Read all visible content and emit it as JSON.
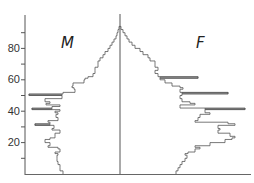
{
  "chart_data": {
    "type": "bar",
    "subtype": "population-pyramid",
    "title": "",
    "xlabel": "",
    "ylabel": "",
    "ylim": [
      0,
      95
    ],
    "yticks_major": [
      20,
      40,
      60,
      80
    ],
    "yticks_minor": [
      10,
      30,
      50,
      70,
      90
    ],
    "grid": false,
    "legend": "none",
    "series_labels": {
      "male": "M",
      "female": "F"
    },
    "units_note": "relative counts (arbitrary units)",
    "ages": [
      0,
      2,
      4,
      6,
      8,
      10,
      12,
      13,
      14,
      16,
      17,
      18,
      20,
      22,
      23,
      24,
      26,
      28,
      29,
      31,
      32,
      33,
      34,
      36,
      38,
      39,
      40,
      41,
      42,
      43,
      44,
      45,
      46,
      48,
      50,
      51,
      52,
      54,
      55,
      56,
      58,
      60,
      61,
      62,
      64,
      66,
      68,
      70,
      72,
      74,
      76,
      78,
      80,
      82,
      84,
      86,
      88,
      90,
      92
    ],
    "series": [
      {
        "name": "M",
        "values": [
          57,
          60,
          60,
          62,
          63,
          63,
          62,
          65,
          60,
          62,
          72,
          70,
          75,
          70,
          65,
          65,
          60,
          68,
          66,
          85,
          70,
          72,
          62,
          64,
          62,
          65,
          60,
          88,
          68,
          60,
          74,
          70,
          75,
          58,
          91,
          57,
          45,
          46,
          48,
          47,
          36,
          35,
          32,
          27,
          25,
          25,
          22,
          22,
          20,
          17,
          15,
          12,
          10,
          8,
          6,
          4,
          3,
          2,
          1
        ]
      },
      {
        "name": "F",
        "values": [
          56,
          58,
          60,
          62,
          65,
          67,
          65,
          68,
          75,
          80,
          75,
          90,
          105,
          112,
          115,
          110,
          98,
          100,
          98,
          115,
          108,
          75,
          78,
          80,
          90,
          85,
          85,
          125,
          60,
          60,
          75,
          70,
          62,
          60,
          62,
          108,
          60,
          63,
          60,
          52,
          45,
          40,
          78,
          38,
          35,
          38,
          35,
          35,
          30,
          28,
          23,
          20,
          15,
          12,
          9,
          7,
          5,
          3,
          1
        ]
      }
    ]
  },
  "labels": {
    "male": "M",
    "female": "F",
    "tick_80": "80",
    "tick_60": "60",
    "tick_40": "40",
    "tick_20": "20"
  },
  "colors": {
    "axis": "#555555",
    "bar_stroke": "#555555",
    "bar_fill": "#bdbdbd",
    "text": "#333333"
  }
}
